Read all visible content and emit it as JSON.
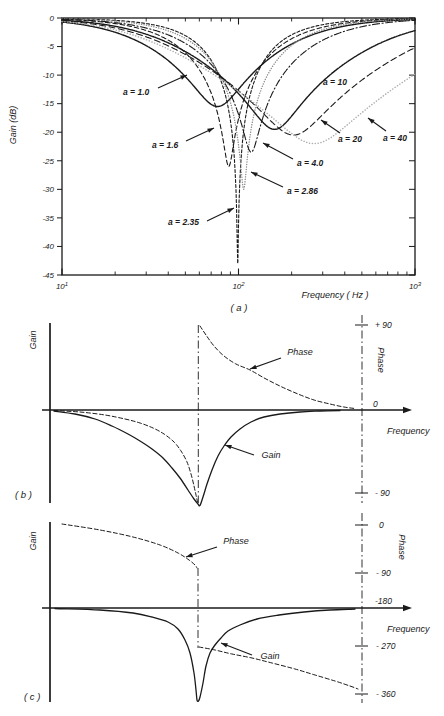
{
  "figure": {
    "bg": "#ffffff",
    "ink": "#1a1a1a",
    "gray": "#8a8a8a",
    "light_gray": "#adadad"
  },
  "chart_data": [
    {
      "id": "a",
      "type": "line",
      "tag": "( a )",
      "xlabel": "Frequency ( Hz )",
      "ylabel": "Gain (dB)",
      "x_scale": "log",
      "x_range_hz": [
        10,
        1000
      ],
      "y_range_db": [
        -45,
        0
      ],
      "x_ticks": [
        {
          "base": "10",
          "exp": "1"
        },
        {
          "base": "10",
          "exp": "2"
        },
        {
          "base": "10",
          "exp": "3"
        }
      ],
      "y_ticks": [
        0,
        -5,
        -10,
        -15,
        -20,
        -25,
        -30,
        -35,
        -40,
        -45
      ],
      "series": [
        {
          "name": "a = 1.0",
          "a": 1.0,
          "notch_hz": 76,
          "min_db": -15.5,
          "w": 3.2,
          "dash": "",
          "width": 1.4,
          "color": "#1a1a1a"
        },
        {
          "name": "a = 1.6",
          "a": 1.6,
          "notch_hz": 88,
          "min_db": -26,
          "w": 2.1,
          "dash": "4.5,2.8",
          "width": 1.1,
          "color": "#1a1a1a"
        },
        {
          "name": "a = 2.35",
          "a": 2.35,
          "notch_hz": 99,
          "min_db": -43,
          "w": 1.5,
          "dash": "3,2",
          "width": 1.1,
          "color": "#1a1a1a"
        },
        {
          "name": "a = 2.86",
          "a": 2.86,
          "notch_hz": 107,
          "min_db": -30,
          "w": 1.9,
          "dash": "0.1,2.4",
          "width": 1.4,
          "color": "#8a8a8a"
        },
        {
          "name": "a = 4.0",
          "a": 4.0,
          "notch_hz": 118,
          "min_db": -23.5,
          "w": 2.6,
          "dash": "7,2.5,1.2,2.5",
          "width": 1.1,
          "color": "#1a1a1a"
        },
        {
          "name": "a = 10",
          "a": 10,
          "notch_hz": 160,
          "min_db": -19.5,
          "w": 5.0,
          "dash": "",
          "width": 1.4,
          "color": "#1a1a1a"
        },
        {
          "name": "a = 20",
          "a": 20,
          "notch_hz": 205,
          "min_db": -20.5,
          "w": 7.2,
          "dash": "6,3.5",
          "width": 1.1,
          "color": "#1a1a1a"
        },
        {
          "name": "a = 40",
          "a": 40,
          "notch_hz": 268,
          "min_db": -22,
          "w": 10.5,
          "dash": "0.1,2.8",
          "width": 1.5,
          "color": "#adadad"
        }
      ],
      "annotations": [
        {
          "text": "a = 1.0",
          "tx": 123,
          "ty": 95,
          "x1": 158,
          "y1": 88,
          "x2": 187,
          "y2": 75
        },
        {
          "text": "a = 1.6",
          "tx": 152,
          "ty": 148,
          "x1": 186,
          "y1": 141,
          "x2": 214,
          "y2": 128
        },
        {
          "text": "a = 2.35",
          "tx": 168,
          "ty": 225,
          "x1": 207,
          "y1": 221,
          "x2": 234,
          "y2": 208
        },
        {
          "text": "a = 2.86",
          "tx": 287,
          "ty": 194,
          "x1": 283,
          "y1": 187,
          "x2": 251,
          "y2": 172
        },
        {
          "text": "a = 4.0",
          "tx": 297,
          "ty": 166,
          "x1": 293,
          "y1": 159,
          "x2": 263,
          "y2": 143
        },
        {
          "text": "a = 10",
          "tx": 323,
          "ty": 85
        },
        {
          "text": "a = 20",
          "tx": 338,
          "ty": 142,
          "x1": 340,
          "y1": 133,
          "x2": 321,
          "y2": 120
        },
        {
          "text": "a = 40",
          "tx": 383,
          "ty": 141,
          "x1": 386,
          "y1": 131,
          "x2": 368,
          "y2": 118
        }
      ]
    },
    {
      "id": "b",
      "type": "line",
      "tag": "( b )",
      "xlabel": "Frequency",
      "ylabel_left": "Gain",
      "ylabel_right": "Phase",
      "phase_ticks": [
        {
          "label": "+ 90",
          "deg": 90,
          "y": 325,
          "lx": 375,
          "ly": 328,
          "mark": true
        },
        {
          "label": "0",
          "deg": 0,
          "y": 410,
          "lx": 373,
          "ly": 407,
          "mark": false
        },
        {
          "label": "- 90",
          "deg": -90,
          "y": 493,
          "lx": 375,
          "ly": 496,
          "mark": true
        }
      ],
      "series": [
        {
          "name": "Phase",
          "dash": "4,2.5",
          "width": 1.0,
          "color": "#1a1a1a",
          "segments": [
            [
              [
                54,
                410.5
              ],
              [
                80,
                412
              ],
              [
                105,
                415
              ],
              [
                125,
                419
              ],
              [
                140,
                423
              ],
              [
                153,
                428
              ],
              [
                164,
                434
              ],
              [
                174,
                442
              ],
              [
                181,
                451
              ],
              [
                187,
                462
              ],
              [
                191,
                474
              ],
              [
                194,
                486
              ],
              [
                196,
                495
              ],
              [
                197.5,
                502
              ]
            ],
            [
              [
                200,
                326
              ],
              [
                206,
                335
              ],
              [
                214,
                346
              ],
              [
                224,
                356
              ],
              [
                236,
                364
              ],
              [
                250,
                370
              ],
              [
                266,
                379
              ],
              [
                282,
                387
              ],
              [
                298,
                394
              ],
              [
                314,
                400
              ],
              [
                330,
                404
              ],
              [
                344,
                407
              ],
              [
                355,
                408.5
              ]
            ]
          ]
        },
        {
          "name": "Gain",
          "dash": "",
          "width": 1.3,
          "color": "#1a1a1a",
          "segments": [
            [
              [
                54,
                411
              ],
              [
                75,
                414
              ],
              [
                95,
                419
              ],
              [
                112,
                426
              ],
              [
                128,
                434
              ],
              [
                140,
                441
              ],
              [
                152,
                449
              ],
              [
                163,
                458
              ],
              [
                172,
                468
              ],
              [
                180,
                478
              ],
              [
                188,
                490
              ],
              [
                194,
                499
              ],
              [
                198,
                504
              ],
              [
                200,
                505.5
              ],
              [
                203,
                497
              ],
              [
                207,
                484
              ],
              [
                212,
                470
              ],
              [
                218,
                456
              ],
              [
                224,
                446
              ],
              [
                231,
                437
              ],
              [
                240,
                429
              ],
              [
                251,
                422
              ],
              [
                264,
                417
              ],
              [
                280,
                414
              ],
              [
                300,
                412
              ],
              [
                320,
                411
              ],
              [
                340,
                410.5
              ]
            ]
          ]
        }
      ],
      "annotations": [
        {
          "text": "Phase",
          "tx": 300,
          "ty": 355,
          "x1": 281,
          "y1": 358,
          "x2": 250,
          "y2": 369
        },
        {
          "text": "Gain",
          "tx": 271,
          "ty": 458,
          "x1": 254,
          "y1": 455,
          "x2": 225,
          "y2": 445
        }
      ]
    },
    {
      "id": "c",
      "type": "line",
      "tag": "( c )",
      "xlabel": "Frequency",
      "ylabel_left": "Gain",
      "ylabel_right": "Phase",
      "phase_ticks": [
        {
          "label": "0",
          "deg": 0,
          "y": 525,
          "lx": 379,
          "ly": 528,
          "mark": true
        },
        {
          "label": "- 90",
          "deg": -90,
          "y": 573,
          "lx": 376,
          "ly": 576,
          "mark": true
        },
        {
          "label": "-180",
          "deg": -180,
          "y": 601,
          "lx": 375,
          "ly": 604,
          "mark": false
        },
        {
          "label": "- 270",
          "deg": -270,
          "y": 646,
          "lx": 376,
          "ly": 649,
          "mark": true
        },
        {
          "label": "- 360",
          "deg": -360,
          "y": 694,
          "lx": 376,
          "ly": 697,
          "mark": true
        }
      ],
      "series": [
        {
          "name": "Phase",
          "dash": "4,2.5",
          "width": 1.0,
          "color": "#1a1a1a",
          "segments": [
            [
              [
                62,
                524
              ],
              [
                100,
                530
              ],
              [
                133,
                537
              ],
              [
                160,
                545
              ],
              [
                178,
                553
              ],
              [
                189,
                560
              ],
              [
                195,
                565
              ],
              [
                197,
                568
              ]
            ],
            [
              [
                199,
                647
              ],
              [
                215,
                650
              ],
              [
                232,
                654
              ],
              [
                252,
                658
              ],
              [
                272,
                663
              ],
              [
                295,
                669
              ],
              [
                315,
                675
              ],
              [
                335,
                681
              ],
              [
                350,
                686
              ],
              [
                358,
                689
              ]
            ]
          ]
        },
        {
          "name": "Gain",
          "dash": "",
          "width": 1.3,
          "color": "#1a1a1a",
          "segments": [
            [
              [
                55,
                608.5
              ],
              [
                100,
                610
              ],
              [
                133,
                613
              ],
              [
                152,
                617
              ],
              [
                168,
                622
              ],
              [
                178,
                629
              ],
              [
                185,
                640
              ],
              [
                190,
                653
              ],
              [
                194,
                673
              ],
              [
                196,
                690
              ],
              [
                197,
                700
              ],
              [
                198.5,
                701
              ],
              [
                200,
                697
              ],
              [
                203,
                683
              ],
              [
                206,
                666
              ],
              [
                210,
                653
              ],
              [
                215,
                645
              ],
              [
                221,
                638
              ],
              [
                228,
                631
              ],
              [
                240,
                625
              ],
              [
                257,
                619
              ],
              [
                279,
                615
              ],
              [
                304,
                612
              ],
              [
                330,
                610
              ],
              [
                355,
                609
              ]
            ]
          ]
        }
      ],
      "annotations": [
        {
          "text": "Phase",
          "tx": 236,
          "ty": 544,
          "x1": 217,
          "y1": 547,
          "x2": 186,
          "y2": 557
        },
        {
          "text": "Gain",
          "tx": 270,
          "ty": 659,
          "x1": 252,
          "y1": 655,
          "x2": 221,
          "y2": 643
        }
      ]
    }
  ]
}
